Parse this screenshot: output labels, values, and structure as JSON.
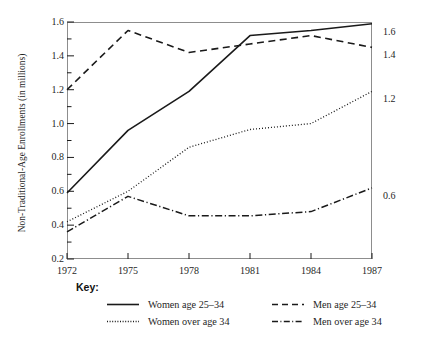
{
  "chart_data": {
    "type": "line",
    "title": "",
    "xlabel": "",
    "ylabel": "Non-Traditional-Age Enrollments (in millions)",
    "x": [
      1972,
      1975,
      1978,
      1981,
      1984,
      1987
    ],
    "xtick_labels": [
      "1972",
      "1975",
      "1978",
      "1981",
      "1984",
      "1987"
    ],
    "ytick_labels": [
      "1.6",
      "1.4",
      "1.2",
      "1.0",
      "0.8",
      "0.6",
      "0.4",
      "0.2"
    ],
    "ytick_values": [
      1.6,
      1.4,
      1.2,
      1.0,
      0.8,
      0.6,
      0.4,
      0.2
    ],
    "ylim": [
      0.2,
      1.6
    ],
    "xlim": [
      1972,
      1987
    ],
    "minor_tick_step": 0.1,
    "grid": false,
    "legend_position": "below-plot",
    "series": [
      {
        "name": "Women age 25–34",
        "style": "solid",
        "values": [
          0.59,
          0.96,
          1.19,
          1.52,
          1.55,
          1.59
        ],
        "end_label": "1.6"
      },
      {
        "name": "Men age 25–34",
        "style": "dashed",
        "values": [
          1.2,
          1.55,
          1.42,
          1.47,
          1.52,
          1.45
        ],
        "end_label": "1.4"
      },
      {
        "name": "Women over age 34",
        "style": "dotted",
        "values": [
          0.42,
          0.6,
          0.86,
          0.965,
          1.0,
          1.19
        ],
        "end_label": "1.2"
      },
      {
        "name": "Men over age 34",
        "style": "dashdot",
        "values": [
          0.36,
          0.57,
          0.455,
          0.455,
          0.48,
          0.62
        ],
        "end_label": "0.6"
      }
    ]
  },
  "legend": {
    "title": "Key:",
    "entries": [
      {
        "label": "Women age 25–34",
        "style": "solid"
      },
      {
        "label": "Women over age 34",
        "style": "dotted"
      },
      {
        "label": "Men age 25–34",
        "style": "dashed"
      },
      {
        "label": "Men over age 34",
        "style": "dashdot"
      }
    ]
  },
  "colors": {
    "line": "#1a1a1a",
    "frame": "#8d8d8d",
    "text": "#1f1f1f",
    "background": "#ffffff"
  }
}
